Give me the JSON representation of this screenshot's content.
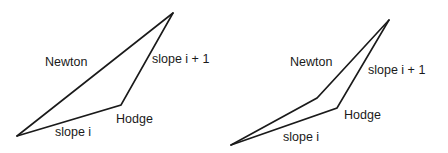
{
  "figures": [
    {
      "name": "left-polygon-figure",
      "labels": {
        "newton": "Newton",
        "slope_i_plus_1": "slope i + 1",
        "hodge": "Hodge",
        "slope_i": "slope i"
      }
    },
    {
      "name": "right-polygon-figure",
      "labels": {
        "newton": "Newton",
        "slope_i_plus_1": "slope i + 1",
        "hodge": "Hodge",
        "slope_i": "slope i"
      }
    }
  ],
  "colors": {
    "line": "#1a1a1a",
    "background": "#ffffff"
  }
}
